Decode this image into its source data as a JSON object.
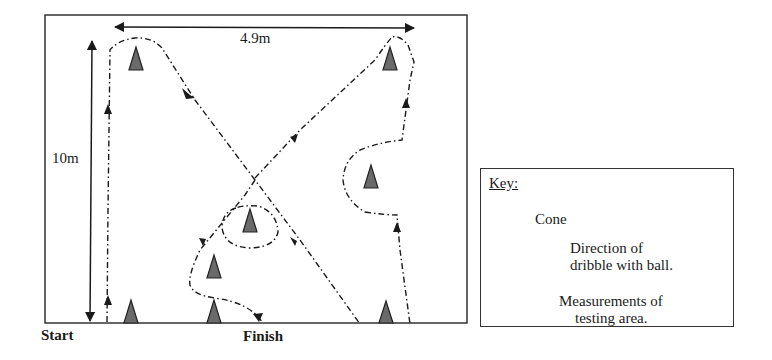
{
  "diagram": {
    "width_label": "4.9m",
    "height_label": "10m",
    "start_label": "Start",
    "finish_label": "Finish",
    "colors": {
      "line": "#1a1a1a",
      "cone_fill": "#6a6a6a",
      "cone_outline": "#222222",
      "background": "#ffffff"
    },
    "cones": [
      {
        "id": "cone-top-left",
        "x": 136,
        "y": 60
      },
      {
        "id": "cone-top-right",
        "x": 390,
        "y": 60
      },
      {
        "id": "cone-right-mid",
        "x": 371,
        "y": 178
      },
      {
        "id": "cone-center",
        "x": 250,
        "y": 222
      },
      {
        "id": "cone-center-low",
        "x": 214,
        "y": 268
      },
      {
        "id": "cone-bottom-1",
        "x": 131,
        "y": 313
      },
      {
        "id": "cone-bottom-2",
        "x": 214,
        "y": 313
      },
      {
        "id": "cone-bottom-3",
        "x": 386,
        "y": 314
      }
    ]
  },
  "key": {
    "title": "Key:",
    "items": [
      {
        "icon": "cone-icon",
        "line1": "Cone",
        "line2": ""
      },
      {
        "icon": "dribble-arrow-icon",
        "line1": "Direction of",
        "line2": "dribble with ball."
      },
      {
        "icon": "measurement-arrow-icon",
        "line1": "Measurements of",
        "line2": "testing area."
      }
    ]
  }
}
